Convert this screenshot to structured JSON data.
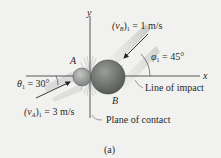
{
  "diagram": {
    "axes": {
      "x_label": "x",
      "y_label": "y"
    },
    "bodies": [
      {
        "id": "A",
        "label": "A",
        "color": "#8a8e8a"
      },
      {
        "id": "B",
        "label": "B",
        "color": "#6f736f"
      }
    ],
    "labels": {
      "vB": "(vB)1 = 1 m/s",
      "vB_sym": "(v",
      "vB_sub": "B",
      "vB_rest": ")",
      "vB_idx": "1",
      "vB_val": " = 1 m/s",
      "phi_sym": "φ",
      "phi_idx": "1",
      "phi_val": " = 45°",
      "theta_sym": "θ",
      "theta_idx": "1",
      "theta_val": " = 30°",
      "vA_sym": "(v",
      "vA_sub": "A",
      "vA_rest": ")",
      "vA_idx": "1",
      "vA_val": " = 3 m/s",
      "line_of_impact": "Line of impact",
      "plane_of_contact": "Plane of contact",
      "caption": "(a)"
    },
    "angles": {
      "theta1_deg": 30,
      "phi1_deg": 45
    },
    "speeds": {
      "vA1_mps": 3,
      "vB1_mps": 1
    }
  }
}
